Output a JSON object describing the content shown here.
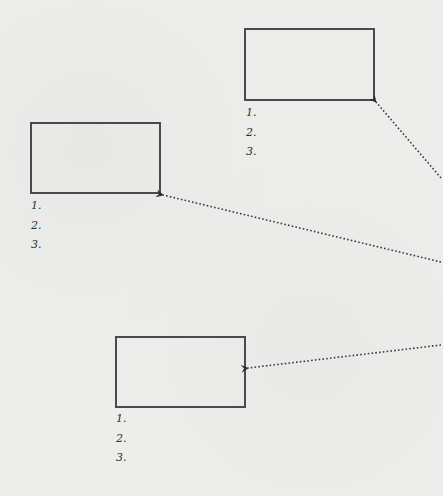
{
  "diagram": {
    "background_color": "#ededeb",
    "stroke_color": "#4a4a4a",
    "arrow_color": "#3a3a3a",
    "boxes": [
      {
        "id": "box-top-right",
        "label": "",
        "list": [
          "1.",
          "2.",
          "3."
        ]
      },
      {
        "id": "box-left",
        "label": "",
        "list": [
          "1.",
          "2.",
          "3."
        ]
      },
      {
        "id": "box-bottom",
        "label": "",
        "list": [
          "1.",
          "2.",
          "3."
        ]
      }
    ],
    "arrows": [
      {
        "from": "right-edge",
        "to": "box-top-right",
        "style": "dotted"
      },
      {
        "from": "right-edge",
        "to": "box-left",
        "style": "dotted"
      },
      {
        "from": "right-edge",
        "to": "box-bottom",
        "style": "dotted"
      }
    ]
  }
}
